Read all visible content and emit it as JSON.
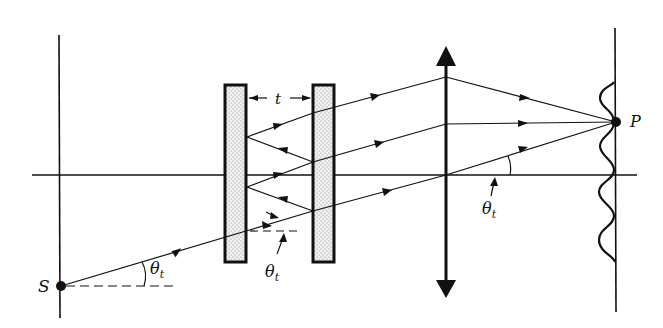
{
  "figure": {
    "labels": {
      "source": "S",
      "point": "P",
      "gap": "t",
      "angle_main": "θ",
      "angle_sub": "t",
      "angle_plate": "θ",
      "angle_plate_sub": "t",
      "angle_lens": "θ",
      "angle_lens_sub": "t"
    },
    "colors": {
      "line": "#111111",
      "plate_fill": "#d9d9d9",
      "background": "#ffffff"
    },
    "elements": [
      "source-plane",
      "optical-axis",
      "plate-left",
      "plate-right",
      "converging-lens",
      "screen",
      "fringe-pattern"
    ]
  }
}
